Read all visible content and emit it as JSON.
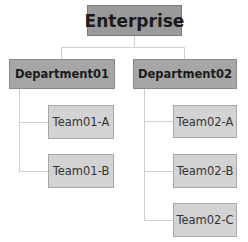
{
  "diagram": {
    "type": "org-chart",
    "root": {
      "label": "Enterprise"
    },
    "departments": [
      {
        "label": "Department01",
        "teams": [
          {
            "label": "Team01-A"
          },
          {
            "label": "Team01-B"
          }
        ]
      },
      {
        "label": "Department02",
        "teams": [
          {
            "label": "Team02-A"
          },
          {
            "label": "Team02-B"
          },
          {
            "label": "Team02-C"
          }
        ]
      }
    ],
    "colors": {
      "root_fill": "#9a9a9a",
      "department_fill": "#a6a6a6",
      "team_fill": "#d3d3d3",
      "connector": "#cfcfcf"
    }
  }
}
